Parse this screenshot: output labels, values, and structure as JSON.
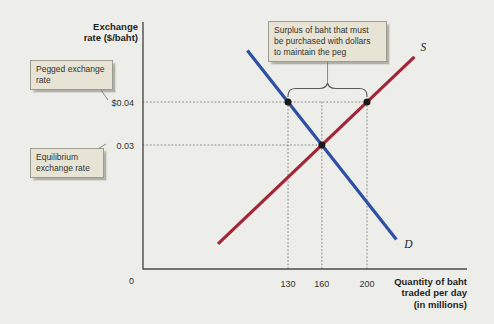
{
  "figure": {
    "y_axis_title_lines": [
      "Exchange",
      "rate ($/baht)"
    ],
    "x_axis_title_lines": [
      "Quantity of baht",
      "traded per day",
      "(in millions)"
    ],
    "origin_label": "0"
  },
  "callouts": {
    "pegged": {
      "lines": [
        "Pegged exchange",
        "rate"
      ]
    },
    "equilibrium": {
      "lines": [
        "Equilibrium",
        "exchange rate"
      ]
    },
    "surplus": {
      "lines": [
        "Surplus of baht that must",
        "be purchased with dollars",
        "to maintain the peg"
      ]
    }
  },
  "colors": {
    "background": "#edeeea",
    "supply_line": "#a32638",
    "demand_line": "#2e4fa3",
    "marker": "#1a1a18",
    "callout_bg": "#e7e4d6"
  },
  "chart_data": {
    "type": "line",
    "xlabel": "Quantity of baht traded per day (in millions)",
    "ylabel": "Exchange rate ($/baht)",
    "x_ticks": [
      {
        "value": 130,
        "label": "130"
      },
      {
        "value": 160,
        "label": "160"
      },
      {
        "value": 200,
        "label": "200"
      }
    ],
    "y_ticks": [
      {
        "value": 0.04,
        "label": "$0.04"
      },
      {
        "value": 0.03,
        "label": "0.03"
      }
    ],
    "series": [
      {
        "name": "S",
        "role": "supply",
        "color": "#a32638",
        "points": [
          {
            "q": 68,
            "r": 0.007
          },
          {
            "q": 242,
            "r": 0.0505
          }
        ]
      },
      {
        "name": "D",
        "role": "demand",
        "color": "#2e4fa3",
        "points": [
          {
            "q": 94,
            "r": 0.052
          },
          {
            "q": 226,
            "r": 0.008
          }
        ]
      }
    ],
    "markers": [
      {
        "q": 130,
        "r": 0.04,
        "meaning": "quantity demanded at pegged rate"
      },
      {
        "q": 200,
        "r": 0.04,
        "meaning": "quantity supplied at pegged rate"
      },
      {
        "q": 160,
        "r": 0.03,
        "meaning": "equilibrium"
      }
    ],
    "guides": {
      "horizontal": [
        {
          "r": 0.04,
          "to_q": 200
        },
        {
          "r": 0.03,
          "to_q": 160
        }
      ],
      "vertical": [
        {
          "q": 130,
          "from_r": 0.04
        },
        {
          "q": 160,
          "from_r": 0.04
        },
        {
          "q": 200,
          "from_r": 0.04
        }
      ]
    },
    "pegged_rate": 0.04,
    "equilibrium": {
      "rate": 0.03,
      "quantity": 160
    },
    "surplus_brace": {
      "from_q": 130,
      "to_q": 200
    },
    "legend": false,
    "grid": false
  }
}
